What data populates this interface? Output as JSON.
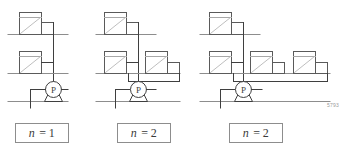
{
  "figure": {
    "kind": "engineering-schematic",
    "figure_id": "5793",
    "top_artifact_text": "",
    "colors": {
      "line": "#3f3f3f",
      "line_light": "#9a9a9a",
      "diagonal": "#b0b0b0",
      "box_border": "#8d8d8d",
      "text": "#3a3a3a",
      "background": "#ffffff"
    }
  },
  "groups": [
    {
      "id": "group-1",
      "label": {
        "variable": "n",
        "equals": "=",
        "value": "1"
      },
      "radiator_count_upper": 1,
      "radiator_count_lower": 1,
      "pump_label": "P",
      "floors": 2
    },
    {
      "id": "group-2",
      "label": {
        "variable": "n",
        "equals": "=",
        "value": "2"
      },
      "radiator_count_upper": 1,
      "radiator_count_lower": 2,
      "pump_label": "P",
      "floors": 2
    },
    {
      "id": "group-3",
      "label": {
        "variable": "n",
        "equals": "=",
        "value": "2"
      },
      "radiator_count_upper": 1,
      "radiator_count_lower": 3,
      "pump_label": "P",
      "floors": 2
    }
  ]
}
